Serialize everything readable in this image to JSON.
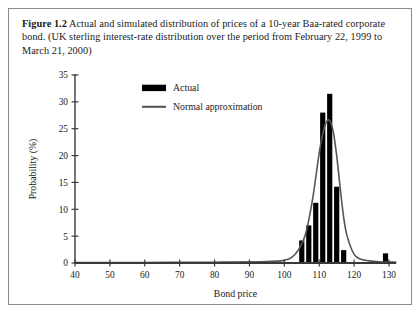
{
  "figure": {
    "number": "Figure 1.2",
    "caption": "Actual and simulated distribution of prices of a 10-year Baa-rated corporate bond. (UK sterling interest-rate distribution over the period from February 22, 1999 to March 21, 2000)"
  },
  "chart_data": {
    "type": "bar",
    "title": "",
    "xlabel": "Bond price",
    "ylabel": "Probability (%)",
    "xlim": [
      40,
      132
    ],
    "ylim": [
      0,
      35
    ],
    "xticks": [
      40,
      50,
      60,
      70,
      80,
      90,
      100,
      110,
      120,
      130
    ],
    "yticks": [
      0,
      5,
      10,
      15,
      20,
      25,
      30,
      35
    ],
    "grid": false,
    "legend_position": "top-left",
    "series": [
      {
        "name": "Actual",
        "type": "bar",
        "color": "#000000",
        "x": [
          105,
          107,
          109,
          111,
          113,
          115,
          117,
          119,
          121,
          129
        ],
        "values": [
          4.2,
          7.0,
          11.2,
          28.0,
          31.5,
          14.2,
          2.4,
          0.0,
          0.0,
          1.8
        ]
      },
      {
        "name": "Normal approximation",
        "type": "line",
        "color": "#555555",
        "x": [
          40,
          60,
          80,
          95,
          100,
          102,
          104,
          106,
          108,
          110,
          111,
          112,
          113,
          114,
          115,
          116,
          117,
          118,
          120,
          122,
          125,
          128,
          132
        ],
        "values": [
          0.1,
          0.1,
          0.15,
          0.25,
          0.5,
          1.0,
          2.4,
          5.2,
          11.5,
          20.5,
          24.0,
          26.2,
          26.5,
          24.5,
          20.0,
          14.0,
          8.5,
          5.0,
          1.6,
          0.7,
          0.35,
          0.2,
          0.15
        ]
      }
    ]
  },
  "legend": {
    "items": [
      {
        "label": "Actual",
        "marker": "bar-swatch",
        "color": "#000000"
      },
      {
        "label": "Normal approximation",
        "marker": "line-swatch",
        "color": "#555555"
      }
    ]
  }
}
